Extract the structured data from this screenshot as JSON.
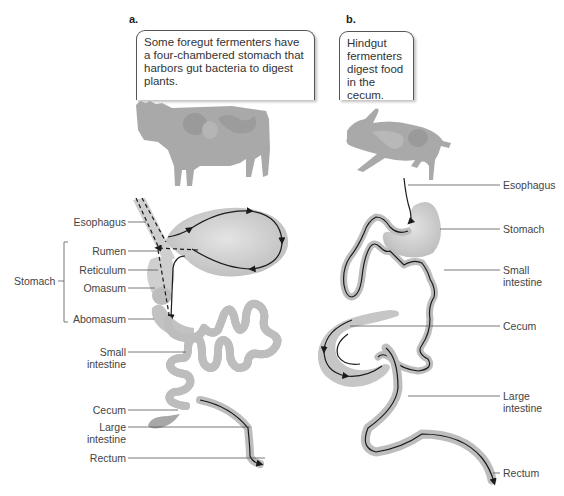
{
  "panel_a": {
    "letter": "a.",
    "callout": "Some foregut fermenters have a four-chambered stomach that harbors gut bacteria to digest plants.",
    "animal": "cow",
    "labels": {
      "esophagus": "Esophagus",
      "stomach": "Stomach",
      "rumen": "Rumen",
      "reticulum": "Reticulum",
      "omasum": "Omasum",
      "abomasum": "Abomasum",
      "small_intestine_1": "Small",
      "small_intestine_2": "intestine",
      "cecum": "Cecum",
      "large_intestine_1": "Large",
      "large_intestine_2": "intestine",
      "rectum": "Rectum"
    }
  },
  "panel_b": {
    "letter": "b.",
    "callout": "Hindgut fermenters digest food in the cecum.",
    "animal": "rabbit",
    "labels": {
      "esophagus": "Esophagus",
      "stomach": "Stomach",
      "small_intestine_1": "Small",
      "small_intestine_2": "intestine",
      "cecum": "Cecum",
      "large_intestine_1": "Large",
      "large_intestine_2": "intestine",
      "rectum": "Rectum"
    }
  },
  "colors": {
    "organ_fill": "#c8c8c8",
    "organ_light": "#dcdcdc",
    "path_line": "#1a1a1a",
    "leader_line": "#555555",
    "animal_silhouette": "#a9a9a9"
  }
}
